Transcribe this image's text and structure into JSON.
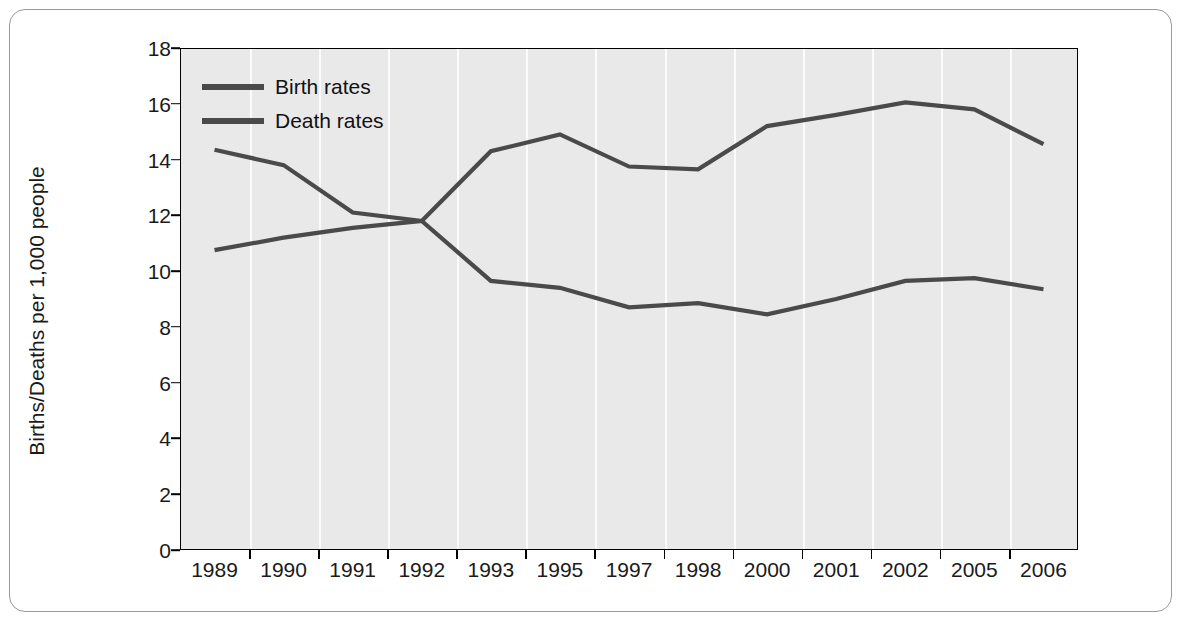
{
  "figure": {
    "caption": ""
  },
  "chart_data": {
    "type": "line",
    "title": "",
    "xlabel": "",
    "ylabel": "Births/Deaths per 1,000 people",
    "categories": [
      "1989",
      "1990",
      "1991",
      "1992",
      "1993",
      "1995",
      "1997",
      "1998",
      "2000",
      "2001",
      "2002",
      "2005",
      "2006"
    ],
    "ylim": [
      0,
      18
    ],
    "yticks": [
      "0",
      "2",
      "4",
      "6",
      "8",
      "10",
      "12",
      "14",
      "16",
      "18"
    ],
    "grid": "vertical",
    "legend_position": "top-left",
    "series": [
      {
        "name": "Birth rates",
        "color": "#4a4a4a",
        "values": [
          10.75,
          11.2,
          11.55,
          11.8,
          14.3,
          14.9,
          13.75,
          13.65,
          15.2,
          15.6,
          16.05,
          15.8,
          14.55
        ]
      },
      {
        "name": "Death rates",
        "color": "#4a4a4a",
        "values": [
          14.35,
          13.8,
          12.1,
          11.8,
          9.65,
          9.4,
          8.7,
          8.85,
          8.45,
          9.0,
          9.65,
          9.75,
          9.35
        ]
      }
    ]
  }
}
